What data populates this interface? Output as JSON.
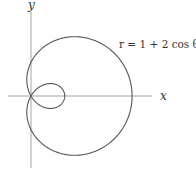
{
  "figure": {
    "equation": "r = 1 + 2 cos θ",
    "x_axis_label": "x",
    "y_axis_label": "y",
    "curve": "limaçon with inner loop",
    "colors": {
      "curve": "#555555",
      "axes": "#999999",
      "text": "#333333"
    }
  }
}
